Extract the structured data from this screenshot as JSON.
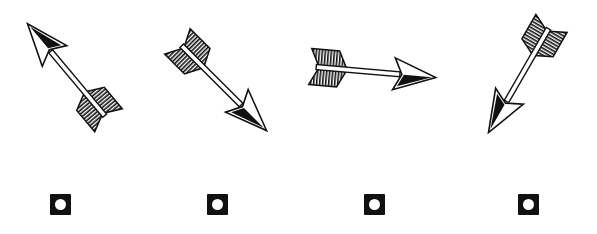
{
  "puzzle": {
    "options": [
      {
        "id": "a",
        "icon": "arrow-up-left-icon",
        "angle_deg": -130,
        "center": [
          68,
          72
        ]
      },
      {
        "id": "b",
        "icon": "arrow-down-right-icon",
        "angle_deg": 45,
        "center": [
          222,
          86
        ]
      },
      {
        "id": "c",
        "icon": "arrow-right-icon",
        "angle_deg": 5,
        "center": [
          373,
          72
        ]
      },
      {
        "id": "d",
        "icon": "arrow-down-left-icon",
        "angle_deg": 120,
        "center": [
          520,
          78
        ]
      }
    ],
    "colors": {
      "ink": "#111111",
      "paper": "#ffffff"
    }
  }
}
